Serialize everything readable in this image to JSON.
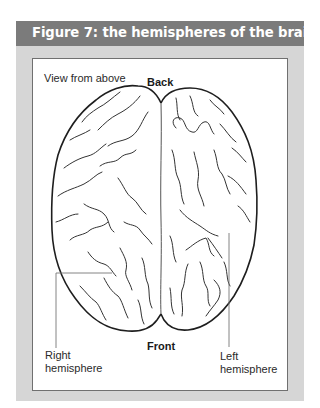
{
  "figure": {
    "title": "Figure 7: the hemispheres of the brain",
    "header_color": "#7b7b7b",
    "panel_color": "#d6d6d6"
  },
  "diagram": {
    "view_label": "View from above",
    "top_label": "Back",
    "bottom_label": "Front",
    "right_hemisphere_label": [
      "Right",
      "hemisphere"
    ],
    "left_hemisphere_label": [
      "Left",
      "hemisphere"
    ]
  }
}
